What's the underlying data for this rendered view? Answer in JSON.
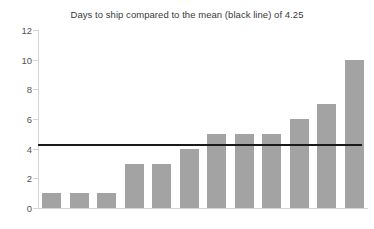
{
  "chart_data": {
    "type": "bar",
    "title": "Days to ship compared to the mean (black line) of 4.25",
    "xlabel": "",
    "ylabel": "",
    "categories": [
      "1",
      "2",
      "3",
      "4",
      "5",
      "6",
      "7",
      "8",
      "9",
      "10",
      "11",
      "12"
    ],
    "values": [
      1,
      1,
      1,
      3,
      3,
      4,
      5,
      5,
      5,
      6,
      7,
      10
    ],
    "ylim": [
      0,
      12
    ],
    "yticks": [
      0,
      2,
      4,
      6,
      8,
      10,
      12
    ],
    "ytick_labels": [
      "0",
      "2",
      "4",
      "6",
      "8",
      "10",
      "12"
    ],
    "xtick_labels": [],
    "grid": false,
    "legend": false,
    "bar_color": "#a3a3a3",
    "axis_color": "#d4d4d4",
    "annotations": [
      {
        "name": "mean-line",
        "type": "hline",
        "value": 4.25,
        "label": "mean (black line) of 4.25",
        "color": "#1a1a1a"
      }
    ]
  }
}
